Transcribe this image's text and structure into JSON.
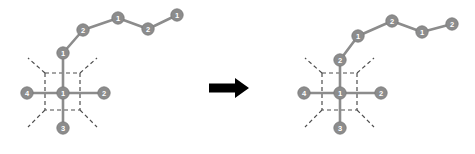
{
  "figure": {
    "background_color": "#ffffff",
    "node_fill": "#8c8c8c",
    "node_stroke": "#7a7a7a",
    "edge_color": "#8c8c8c",
    "dashed_color": "#4d4d4d",
    "label_color": "#ffffff",
    "arrow_color": "#000000",
    "node_radius": 6.2,
    "edge_width": 2.6,
    "dash_pattern": "4,3"
  },
  "arrow": {
    "name": "transformation-arrow",
    "glyph": "right-arrow",
    "x": 209,
    "y": 88,
    "length": 40,
    "shaft_height": 9,
    "head_width": 14,
    "head_height": 20
  },
  "left_diagram": {
    "name": "before-state",
    "dashed_box": {
      "x": 45,
      "y": 73,
      "width": 35,
      "height": 37
    },
    "diagonals": [
      {
        "name": "diagonal-top-left",
        "x1": 45,
        "y1": 73,
        "x2": 28,
        "y2": 58
      },
      {
        "name": "diagonal-top-right",
        "x1": 80,
        "y1": 73,
        "x2": 97,
        "y2": 58
      },
      {
        "name": "diagonal-bottom-left",
        "x1": 45,
        "y1": 110,
        "x2": 28,
        "y2": 127
      },
      {
        "name": "diagonal-bottom-right",
        "x1": 80,
        "y1": 110,
        "x2": 97,
        "y2": 127
      }
    ],
    "nodes": [
      {
        "id": "center",
        "label": "1",
        "x": 63,
        "y": 93
      },
      {
        "id": "left",
        "label": "4",
        "x": 27,
        "y": 93
      },
      {
        "id": "right",
        "label": "2",
        "x": 104,
        "y": 93
      },
      {
        "id": "bottom",
        "label": "3",
        "x": 63,
        "y": 128
      },
      {
        "id": "chain1",
        "label": "1",
        "x": 63,
        "y": 53
      },
      {
        "id": "chain2",
        "label": "2",
        "x": 83,
        "y": 30
      },
      {
        "id": "chain3",
        "label": "1",
        "x": 118,
        "y": 18
      },
      {
        "id": "chain4",
        "label": "2",
        "x": 148,
        "y": 29
      },
      {
        "id": "chain5",
        "label": "1",
        "x": 177,
        "y": 15
      }
    ],
    "edges": [
      {
        "from": "left",
        "to": "center"
      },
      {
        "from": "center",
        "to": "right"
      },
      {
        "from": "center",
        "to": "bottom"
      },
      {
        "from": "center",
        "to": "chain1"
      },
      {
        "from": "chain1",
        "to": "chain2"
      },
      {
        "from": "chain2",
        "to": "chain3"
      },
      {
        "from": "chain3",
        "to": "chain4"
      },
      {
        "from": "chain4",
        "to": "chain5"
      }
    ]
  },
  "right_diagram": {
    "name": "after-state",
    "dashed_box": {
      "x": 322,
      "y": 73,
      "width": 35,
      "height": 37
    },
    "diagonals": [
      {
        "name": "diagonal-top-left",
        "x1": 322,
        "y1": 73,
        "x2": 305,
        "y2": 58
      },
      {
        "name": "diagonal-top-right",
        "x1": 357,
        "y1": 73,
        "x2": 374,
        "y2": 58
      },
      {
        "name": "diagonal-bottom-left",
        "x1": 322,
        "y1": 110,
        "x2": 305,
        "y2": 127
      },
      {
        "name": "diagonal-bottom-right",
        "x1": 357,
        "y1": 110,
        "x2": 374,
        "y2": 127
      }
    ],
    "nodes": [
      {
        "id": "center",
        "label": "1",
        "x": 340,
        "y": 93
      },
      {
        "id": "left",
        "label": "4",
        "x": 304,
        "y": 93
      },
      {
        "id": "right",
        "label": "2",
        "x": 381,
        "y": 93
      },
      {
        "id": "bottom",
        "label": "3",
        "x": 340,
        "y": 128
      },
      {
        "id": "chain1",
        "label": "2",
        "x": 340,
        "y": 60
      },
      {
        "id": "chain2",
        "label": "1",
        "x": 358,
        "y": 36
      },
      {
        "id": "chain3",
        "label": "2",
        "x": 392,
        "y": 21
      },
      {
        "id": "chain4",
        "label": "1",
        "x": 422,
        "y": 32
      },
      {
        "id": "chain5",
        "label": "2",
        "x": 452,
        "y": 24
      }
    ],
    "edges": [
      {
        "from": "left",
        "to": "center"
      },
      {
        "from": "center",
        "to": "right"
      },
      {
        "from": "center",
        "to": "bottom"
      },
      {
        "from": "center",
        "to": "chain1"
      },
      {
        "from": "chain1",
        "to": "chain2"
      },
      {
        "from": "chain2",
        "to": "chain3"
      },
      {
        "from": "chain3",
        "to": "chain4"
      },
      {
        "from": "chain4",
        "to": "chain5"
      }
    ]
  }
}
